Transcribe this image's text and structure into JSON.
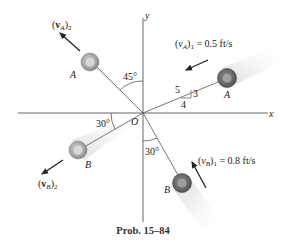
{
  "diagram": {
    "axes": {
      "x_label": "x",
      "y_label": "y",
      "origin_label": "O"
    },
    "ball_A": {
      "label": "A",
      "before": {
        "velocity_label": "(v_A)_1 = 0.5 ft/s",
        "v_sym": "(",
        "v_letter": "v",
        "v_sub": "A",
        "v_close": ")",
        "v_idx": "1",
        "v_value": " = 0.5 ft/s",
        "slope": {
          "hyp": "5",
          "rise": "3",
          "run": "4"
        }
      },
      "after": {
        "velocity_label": "(v_A)_2",
        "v_open": "(",
        "v_letter": "v",
        "v_sub": "A",
        "v_close": ")",
        "v_idx": "2",
        "angle_from_y": "45°"
      }
    },
    "ball_B": {
      "label": "B",
      "before": {
        "velocity_label": "(v_B)_1 = 0.8 ft/s",
        "v_open": "(",
        "v_letter": "v",
        "v_sub": "B",
        "v_close": ")",
        "v_idx": "1",
        "v_value": " = 0.8 ft/s",
        "angle_from_y": "30°"
      },
      "after": {
        "velocity_label": "(v_B)_2",
        "v_open": "(",
        "v_letter": "v",
        "v_sub": "B",
        "v_close": ")",
        "v_idx": "2",
        "angle_from_x": "30°"
      }
    },
    "caption": "Prob. 15–84",
    "colors": {
      "line": "#555555",
      "arrow": "#222222",
      "disk_outer": "#8a8a8a",
      "disk_inner": "#c8c8c8",
      "trail": "#d9d9d9"
    }
  }
}
